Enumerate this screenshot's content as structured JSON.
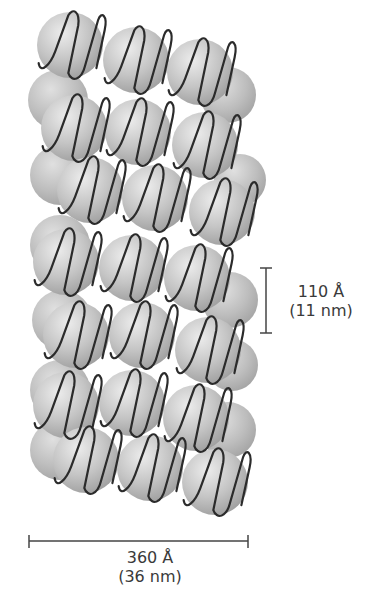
{
  "diagram": {
    "colors": {
      "nucleosome_light": "#e2e2e2",
      "nucleosome_mid": "#bdbdbd",
      "nucleosome_dark": "#9a9a9a",
      "dna_strand": "#2b2b2b",
      "scale_bar": "#444444",
      "text": "#3a3a3a"
    },
    "layers": 7,
    "nucleosomes": [
      {
        "x": 70,
        "y": 45,
        "r": 33,
        "z": 1
      },
      {
        "x": 136,
        "y": 60,
        "r": 33,
        "z": 1
      },
      {
        "x": 200,
        "y": 72,
        "r": 33,
        "z": 1
      },
      {
        "x": 228,
        "y": 95,
        "r": 28,
        "z": 0
      },
      {
        "x": 58,
        "y": 100,
        "r": 30,
        "z": 0
      },
      {
        "x": 74,
        "y": 128,
        "r": 33,
        "z": 1
      },
      {
        "x": 138,
        "y": 132,
        "r": 33,
        "z": 1
      },
      {
        "x": 205,
        "y": 145,
        "r": 33,
        "z": 1
      },
      {
        "x": 60,
        "y": 175,
        "r": 30,
        "z": 0
      },
      {
        "x": 90,
        "y": 190,
        "r": 33,
        "z": 1
      },
      {
        "x": 155,
        "y": 198,
        "r": 33,
        "z": 1
      },
      {
        "x": 222,
        "y": 212,
        "r": 33,
        "z": 1
      },
      {
        "x": 240,
        "y": 180,
        "r": 26,
        "z": 0
      },
      {
        "x": 60,
        "y": 245,
        "r": 30,
        "z": 0
      },
      {
        "x": 66,
        "y": 262,
        "r": 33,
        "z": 1
      },
      {
        "x": 132,
        "y": 268,
        "r": 33,
        "z": 1
      },
      {
        "x": 197,
        "y": 278,
        "r": 33,
        "z": 1
      },
      {
        "x": 230,
        "y": 300,
        "r": 28,
        "z": 0
      },
      {
        "x": 62,
        "y": 320,
        "r": 30,
        "z": 0
      },
      {
        "x": 76,
        "y": 335,
        "r": 33,
        "z": 1
      },
      {
        "x": 142,
        "y": 335,
        "r": 33,
        "z": 1
      },
      {
        "x": 208,
        "y": 350,
        "r": 33,
        "z": 1
      },
      {
        "x": 232,
        "y": 365,
        "r": 26,
        "z": 0
      },
      {
        "x": 60,
        "y": 390,
        "r": 30,
        "z": 0
      },
      {
        "x": 66,
        "y": 405,
        "r": 33,
        "z": 1
      },
      {
        "x": 132,
        "y": 403,
        "r": 33,
        "z": 1
      },
      {
        "x": 196,
        "y": 418,
        "r": 33,
        "z": 1
      },
      {
        "x": 228,
        "y": 430,
        "r": 28,
        "z": 0
      },
      {
        "x": 60,
        "y": 450,
        "r": 30,
        "z": 0
      },
      {
        "x": 86,
        "y": 460,
        "r": 33,
        "z": 1
      },
      {
        "x": 150,
        "y": 468,
        "r": 33,
        "z": 1
      },
      {
        "x": 215,
        "y": 482,
        "r": 33,
        "z": 1
      }
    ],
    "scale_bars": {
      "vertical": {
        "value": "110 Å",
        "unit_alt": "(11 nm)",
        "x": 266,
        "y1": 268,
        "y2": 333
      },
      "horizontal": {
        "value": "360 Å",
        "unit_alt": "(36 nm)",
        "x1": 29,
        "x2": 248,
        "y": 541
      }
    }
  }
}
